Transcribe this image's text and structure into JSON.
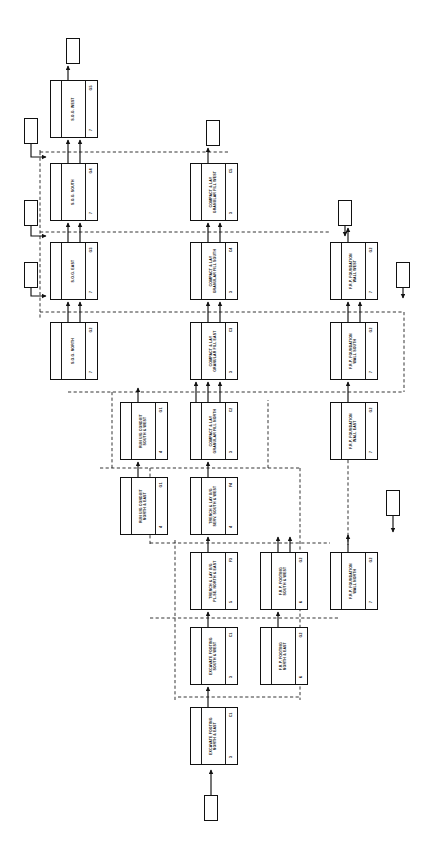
{
  "diagram": {
    "type": "activity-on-node-network",
    "nodes": [
      {
        "id": "n01",
        "code": "G5",
        "desc": "S.O.G. WEST",
        "duration": "7",
        "x": 50,
        "y": 80,
        "w": 48,
        "h": 58
      },
      {
        "id": "n02",
        "code": "G4",
        "desc": "S.O.G. SOUTH",
        "duration": "7",
        "x": 50,
        "y": 163,
        "w": 48,
        "h": 58
      },
      {
        "id": "n03",
        "code": "G3",
        "desc": "S.O.G. EAST",
        "duration": "7",
        "x": 50,
        "y": 242,
        "w": 48,
        "h": 58
      },
      {
        "id": "n04",
        "code": "G2",
        "desc": "S.O.G. NORTH",
        "duration": "7",
        "x": 50,
        "y": 322,
        "w": 48,
        "h": 58
      },
      {
        "id": "n05",
        "code": "C5",
        "desc": "COMPACT & LAY\nGRANULAR FILL WEST",
        "duration": "3",
        "x": 190,
        "y": 163,
        "w": 48,
        "h": 58
      },
      {
        "id": "n06",
        "code": "C4",
        "desc": "COMPACT & LAY\nGRANULAR FILL SOUTH",
        "duration": "3",
        "x": 190,
        "y": 242,
        "w": 48,
        "h": 58
      },
      {
        "id": "n07",
        "code": "C3",
        "desc": "COMPACT & LAY\nGRANULAR FILL EAST",
        "duration": "3",
        "x": 190,
        "y": 322,
        "w": 48,
        "h": 58
      },
      {
        "id": "n08",
        "code": "C2",
        "desc": "COMPACT & LAY\nGRANULAR FILL NORTH",
        "duration": "3",
        "x": 190,
        "y": 402,
        "w": 48,
        "h": 58
      },
      {
        "id": "n09",
        "code": "G2",
        "desc": "F.R.P. FOUNDATION\nWALL WEST",
        "duration": "7",
        "x": 330,
        "y": 242,
        "w": 48,
        "h": 58
      },
      {
        "id": "n10",
        "code": "G2",
        "desc": "F.R.P. FOUNDATION\nWALL SOUTH",
        "duration": "7",
        "x": 330,
        "y": 322,
        "w": 48,
        "h": 58
      },
      {
        "id": "n11",
        "code": "G2",
        "desc": "F.R.P. FOUNDATION\nWALL EAST",
        "duration": "7",
        "x": 330,
        "y": 402,
        "w": 48,
        "h": 58
      },
      {
        "id": "n12",
        "code": "G2",
        "desc": "F.R.P. FOUNDATION\nWALL NORTH",
        "duration": "7",
        "x": 330,
        "y": 552,
        "w": 48,
        "h": 58
      },
      {
        "id": "n13",
        "code": "G1",
        "desc": "RUN U/G CONDUIT\nSOUTH & WEST",
        "duration": "4",
        "x": 120,
        "y": 402,
        "w": 48,
        "h": 58
      },
      {
        "id": "n14",
        "code": "G1",
        "desc": "RUN U/G CONDUIT\nNORTH & EAST",
        "duration": "4",
        "x": 120,
        "y": 477,
        "w": 48,
        "h": 58
      },
      {
        "id": "n15",
        "code": "F4",
        "desc": "TRENCH & LAY U/G\nSERV. SOUTH & WEST",
        "duration": "4",
        "x": 190,
        "y": 477,
        "w": 48,
        "h": 58
      },
      {
        "id": "n16",
        "code": "F3",
        "desc": "TRENCH & LAY U/G\nPL.SE. NORTH & EAST",
        "duration": "5",
        "x": 190,
        "y": 552,
        "w": 48,
        "h": 58
      },
      {
        "id": "n17",
        "code": "C1",
        "desc": "EXCAVATE FOOTING\nSOUTH & WEST",
        "duration": "3",
        "x": 190,
        "y": 627,
        "w": 48,
        "h": 58
      },
      {
        "id": "n18",
        "code": "C1",
        "desc": "EXCAVATE FOOTING\nNORTH & EAST",
        "duration": "3",
        "x": 190,
        "y": 707,
        "w": 48,
        "h": 58
      },
      {
        "id": "n19",
        "code": "G2",
        "desc": "F.R.P. FOOTING\nSOUTH & WEST",
        "duration": "6",
        "x": 260,
        "y": 552,
        "w": 48,
        "h": 58
      },
      {
        "id": "n20",
        "code": "G2",
        "desc": "F.R.P. FOOTING\nNORTH & EAST",
        "duration": "6",
        "x": 260,
        "y": 627,
        "w": 48,
        "h": 58
      }
    ],
    "milestones": [
      {
        "id": "m1",
        "x": 66,
        "y": 38,
        "w": 14,
        "h": 26
      },
      {
        "id": "m2",
        "x": 24,
        "y": 118,
        "w": 14,
        "h": 26
      },
      {
        "id": "m3",
        "x": 206,
        "y": 120,
        "w": 14,
        "h": 26
      },
      {
        "id": "m4",
        "x": 24,
        "y": 200,
        "w": 14,
        "h": 26
      },
      {
        "id": "m5",
        "x": 338,
        "y": 200,
        "w": 14,
        "h": 26
      },
      {
        "id": "m6",
        "x": 24,
        "y": 262,
        "w": 14,
        "h": 26
      },
      {
        "id": "m7",
        "x": 396,
        "y": 262,
        "w": 14,
        "h": 26
      },
      {
        "id": "m8",
        "x": 386,
        "y": 490,
        "w": 14,
        "h": 26
      },
      {
        "id": "m9",
        "x": 204,
        "y": 795,
        "w": 14,
        "h": 26
      }
    ],
    "legend": {
      "box_fields": [
        "code",
        "description",
        "duration"
      ],
      "solid_arrow_meaning": "finish-to-start dependency",
      "dashed_arrow_meaning": "lag / cross-link dependency"
    }
  }
}
